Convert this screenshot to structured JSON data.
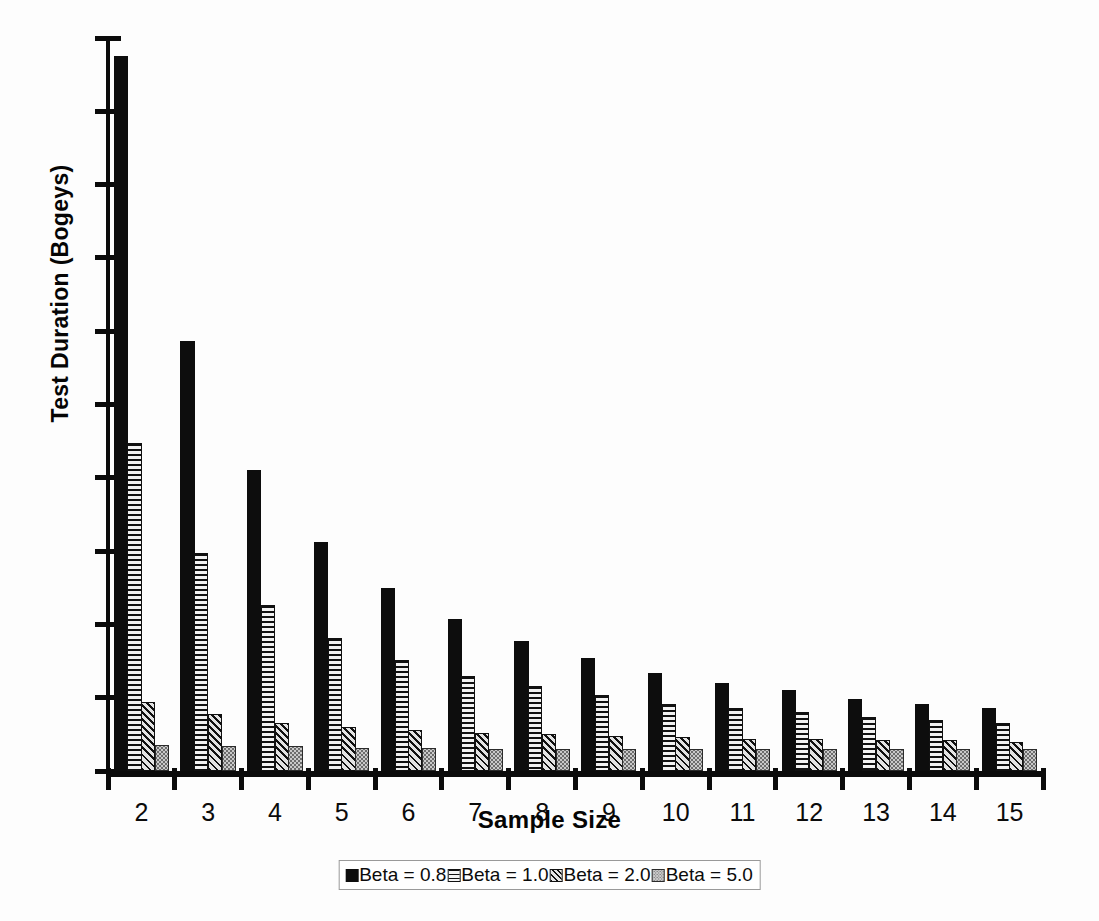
{
  "chart_data": {
    "type": "bar",
    "title": "",
    "xlabel": "Sample Size",
    "ylabel": "Test Duration (Bogeys)",
    "categories": [
      "2",
      "3",
      "4",
      "5",
      "6",
      "7",
      "8",
      "9",
      "10",
      "11",
      "12",
      "13",
      "14",
      "15"
    ],
    "ylim": [
      0,
      50
    ],
    "yticks": [
      0,
      5,
      10,
      15,
      20,
      25,
      30,
      35,
      40,
      45,
      50
    ],
    "grid": false,
    "legend_position": "bottom",
    "series": [
      {
        "name": "Beta = 0.8",
        "pattern": "solid-black",
        "color": "#0d0d0d",
        "values": [
          48.8,
          29.3,
          20.5,
          15.6,
          12.5,
          10.4,
          8.9,
          7.7,
          6.7,
          6.0,
          5.5,
          4.9,
          4.6,
          4.3
        ]
      },
      {
        "name": "Beta = 1.0",
        "pattern": "horizontal-lines",
        "color": "#111111",
        "values": [
          22.4,
          14.9,
          11.3,
          9.1,
          7.6,
          6.5,
          5.8,
          5.2,
          4.6,
          4.3,
          4.0,
          3.7,
          3.5,
          3.3
        ]
      },
      {
        "name": "Beta = 2.0",
        "pattern": "diagonal-hatch",
        "color": "#111111",
        "values": [
          4.7,
          3.9,
          3.3,
          3.0,
          2.8,
          2.6,
          2.5,
          2.4,
          2.3,
          2.2,
          2.2,
          2.1,
          2.1,
          2.0
        ]
      },
      {
        "name": "Beta = 5.0",
        "pattern": "light-stipple",
        "color": "#c9c9c9",
        "values": [
          1.8,
          1.7,
          1.7,
          1.6,
          1.6,
          1.5,
          1.5,
          1.5,
          1.5,
          1.5,
          1.5,
          1.5,
          1.5,
          1.5
        ]
      }
    ]
  }
}
